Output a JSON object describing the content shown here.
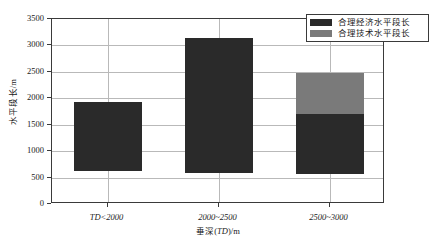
{
  "chart_data": {
    "type": "bar",
    "title": "",
    "subtitle": "",
    "xlabel": "垂深(TD)/m",
    "ylabel": "水平段长/m",
    "categories": [
      "TD<2000",
      "2000~2500",
      "2500~3000"
    ],
    "series": [
      {
        "name": "合理经济水平段长",
        "color": "#2a2a2a",
        "bases": [
          620,
          590,
          570
        ],
        "tops": [
          1930,
          3150,
          1710
        ]
      },
      {
        "name": "合理技术水平段长",
        "color": "#7a7a7a",
        "bases": [
          null,
          null,
          1710
        ],
        "tops": [
          null,
          null,
          2480
        ]
      }
    ],
    "ylim": [
      0,
      3500
    ],
    "yticks": [
      0,
      500,
      1000,
      1500,
      2000,
      2500,
      3000,
      3500
    ],
    "ytick_labels": [
      "0",
      "500",
      "1000",
      "1500",
      "2000",
      "2500",
      "3000",
      "3500"
    ],
    "grid": "horizontal-and-vertical",
    "legend_position": "top-right",
    "stacked": true
  },
  "legend": {
    "items": [
      {
        "label": "合理经济水平段长",
        "color": "#2a2a2a"
      },
      {
        "label": "合理技术水平段长",
        "color": "#7a7a7a"
      }
    ]
  },
  "axes": {
    "y_title": "水平段长/m",
    "x_title_prefix": "垂深(",
    "x_title_italic": "TD",
    "x_title_suffix": ")/m"
  }
}
